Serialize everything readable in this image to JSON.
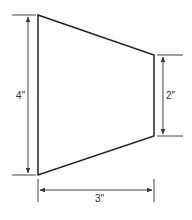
{
  "diagram": {
    "shape": "trapezoid",
    "colors": {
      "stroke": "#222222",
      "dim": "#444444",
      "text": "#333333",
      "background": "#ffffff"
    },
    "trapezoid": {
      "points": [
        [
          38,
          15
        ],
        [
          154,
          55
        ],
        [
          154,
          136
        ],
        [
          38,
          175
        ]
      ]
    },
    "dimensions": {
      "left_height": {
        "label": "4\"",
        "x": 28,
        "y1": 15,
        "y2": 175,
        "ext_x1": 12,
        "ext_x2": 36,
        "label_x": 21,
        "label_y": 99
      },
      "right_height": {
        "label": "2\"",
        "x": 163,
        "y1": 55,
        "y2": 136,
        "ext_x1": 157,
        "ext_x2": 183,
        "label_x": 172,
        "label_y": 99
      },
      "bottom_width": {
        "label": "3\"",
        "y": 190,
        "x1": 38,
        "x2": 154,
        "ext_y1": 179,
        "ext_y2": 202,
        "label_x": 100,
        "label_y": 201
      }
    }
  }
}
